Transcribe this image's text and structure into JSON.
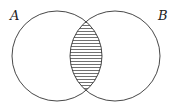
{
  "diagram": {
    "type": "venn",
    "sets": [
      {
        "label": "A",
        "shaded": false
      },
      {
        "label": "B",
        "shaded": false
      }
    ],
    "shaded_region": "A ∩ B",
    "shading_pattern": "horizontal-lines",
    "stroke_color": "#333333"
  }
}
